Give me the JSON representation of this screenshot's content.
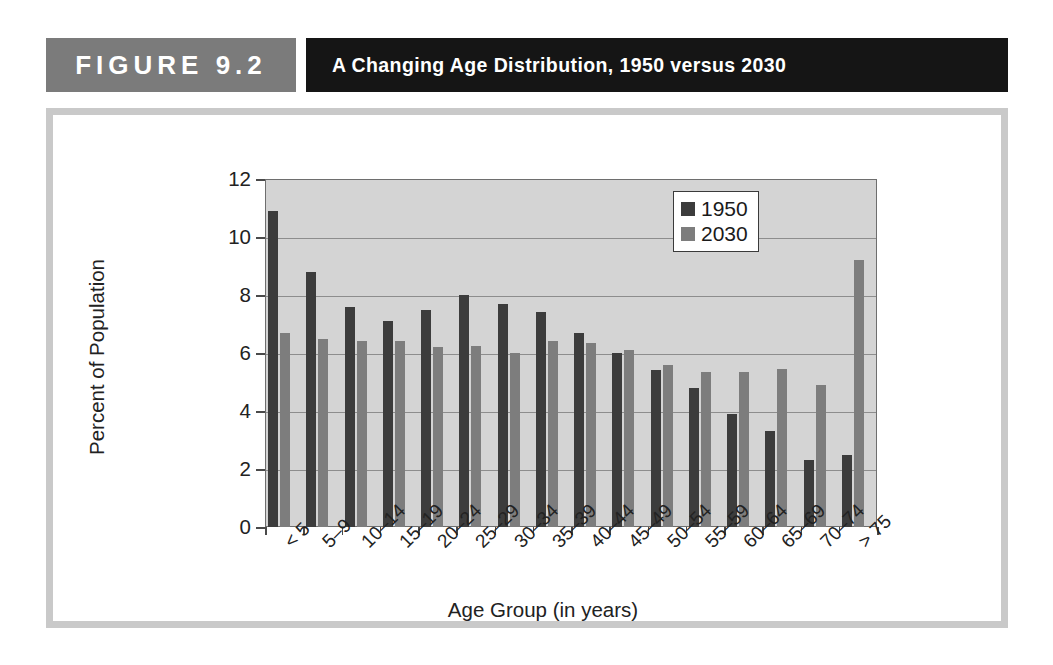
{
  "header": {
    "figure_label": "FIGURE  9.2",
    "figure_title": "A Changing Age Distribution, 1950 versus 2030"
  },
  "chart_data": {
    "type": "bar",
    "title": "A Changing Age Distribution, 1950 versus 2030",
    "xlabel": "Age Group (in years)",
    "ylabel": "Percent of Population",
    "ylim": [
      0,
      12
    ],
    "yticks": [
      0,
      2,
      4,
      6,
      8,
      10,
      12
    ],
    "grid": true,
    "legend_position": "top-right",
    "categories": [
      "< 5",
      "5–9",
      "10–14",
      "15–19",
      "20–24",
      "25–29",
      "30–34",
      "35–39",
      "40–44",
      "45–49",
      "50–54",
      "55–59",
      "60–64",
      "65–69",
      "70–74",
      "> 75"
    ],
    "series": [
      {
        "name": "1950",
        "color": "#3c3c3c",
        "values": [
          10.9,
          8.8,
          7.6,
          7.1,
          7.5,
          8.0,
          7.7,
          7.4,
          6.7,
          6.0,
          5.4,
          4.8,
          3.9,
          3.3,
          2.3,
          2.5
        ]
      },
      {
        "name": "2030",
        "color": "#7d7d7d",
        "values": [
          6.7,
          6.5,
          6.4,
          6.4,
          6.2,
          6.25,
          6.0,
          6.4,
          6.35,
          6.1,
          5.6,
          5.35,
          5.35,
          5.45,
          4.9,
          9.2
        ]
      }
    ]
  }
}
